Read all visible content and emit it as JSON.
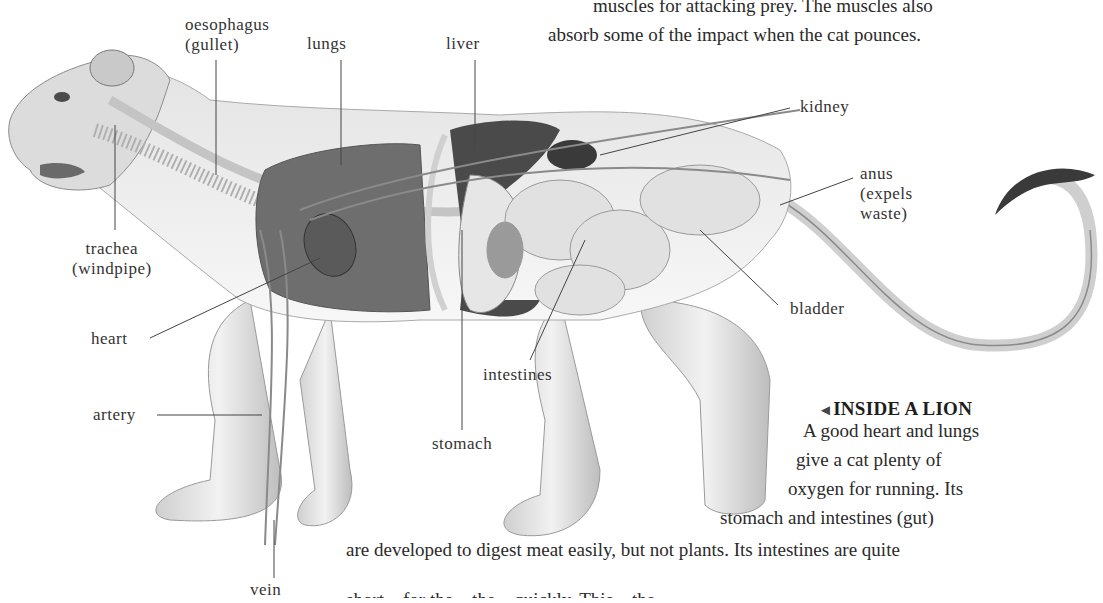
{
  "intro_text": {
    "lines": [
      "muscles for attacking prey. The muscles also",
      "absorb some of the impact when the cat pounces."
    ]
  },
  "illustration": {
    "subject": "lion anatomy cutaway",
    "labels": {
      "oesophagus": "oesophagus\n(gullet)",
      "lungs": "lungs",
      "liver": "liver",
      "kidney": "kidney",
      "anus": "anus\n(expels\nwaste)",
      "trachea": "trachea\n(windpipe)",
      "heart": "heart",
      "bladder": "bladder",
      "intestines": "intestines",
      "artery": "artery",
      "stomach": "stomach",
      "vein": "vein"
    }
  },
  "caption": {
    "arrow_icon": "◄",
    "heading": "INSIDE A LION",
    "lines": [
      "A good heart and lungs",
      "give a cat plenty of",
      "oxygen for running. Its",
      "stomach and intestines (gut)",
      "are developed to digest meat easily, but not plants. Its intestines are quite",
      "short... for the... the... quickly. This... the..."
    ]
  }
}
